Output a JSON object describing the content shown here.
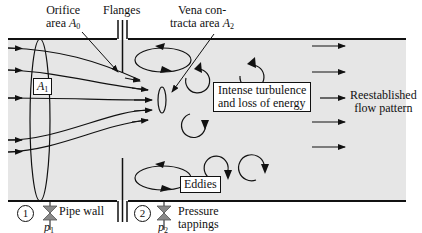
{
  "diagram": {
    "colors": {
      "pipe_fill": "#e6e6e6",
      "line": "#111111",
      "valve": "#8a8a8a",
      "background": "#ffffff"
    },
    "labels": {
      "orifice_line1": "Orifice",
      "orifice_line2": "area",
      "orifice_symbol": "A",
      "orifice_sub": "0",
      "flanges": "Flanges",
      "vena_line1": "Vena con-",
      "vena_line2": "tracta area",
      "vena_symbol": "A",
      "vena_sub": "2",
      "a1_symbol": "A",
      "a1_sub": "1",
      "turbulence_line1": "Intense turbulence",
      "turbulence_line2": "and loss of energy",
      "eddies": "Eddies",
      "reestablished_line1": "Reestablished",
      "reestablished_line2": "flow pattern",
      "pipe_wall": "Pipe wall",
      "pressure_line1": "Pressure",
      "pressure_line2": "tappings",
      "tap1_number": "1",
      "tap2_number": "2",
      "p1_symbol": "p",
      "p1_sub": "1",
      "p2_symbol": "p",
      "p2_sub": "2"
    }
  }
}
